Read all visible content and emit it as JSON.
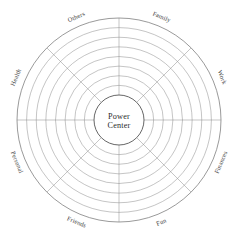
{
  "diagram": {
    "type": "wheel-of-life",
    "center_label_line1": "Power",
    "center_label_line2": "Center",
    "ring_count": 8,
    "sector_count": 8,
    "colors": {
      "ring_stroke": "#8a8a8a",
      "outer_ring_stroke": "#6e6e6e",
      "center_stroke": "#555555",
      "text": "#2b2b2b",
      "label_text": "#3a3a3a",
      "background": "#ffffff"
    },
    "sectors": [
      {
        "label": "Family",
        "angle_deg": -67.5
      },
      {
        "label": "Work",
        "angle_deg": -22.5
      },
      {
        "label": "Finances",
        "angle_deg": 22.5
      },
      {
        "label": "Fun",
        "angle_deg": 67.5
      },
      {
        "label": "Friends",
        "angle_deg": 112.5
      },
      {
        "label": "Personal",
        "angle_deg": 157.5
      },
      {
        "label": "Health",
        "angle_deg": 202.5
      },
      {
        "label": "Others",
        "angle_deg": 247.5
      }
    ],
    "geometry": {
      "cx": 119,
      "cy": 120,
      "outer_radius": 102,
      "center_radius": 25,
      "label_radius": 111
    }
  }
}
